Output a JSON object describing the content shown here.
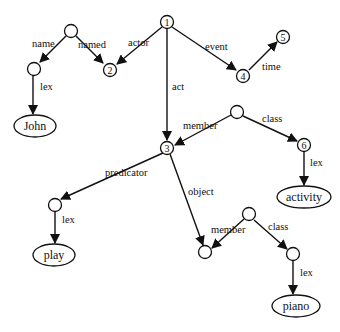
{
  "diagram": {
    "type": "semantic-network",
    "nodes": {
      "n1": {
        "label": "1"
      },
      "n2": {
        "label": "2"
      },
      "n3": {
        "label": "3"
      },
      "n4": {
        "label": "4"
      },
      "n5": {
        "label": "5"
      },
      "n6": {
        "label": "6"
      },
      "john": {
        "label": "John"
      },
      "activity": {
        "label": "activity"
      },
      "play": {
        "label": "play"
      },
      "piano": {
        "label": "piano"
      }
    },
    "edges": {
      "name": {
        "label": "name"
      },
      "named": {
        "label": "named"
      },
      "lex_john": {
        "label": "lex"
      },
      "actor": {
        "label": "actor"
      },
      "event": {
        "label": "event"
      },
      "time": {
        "label": "time"
      },
      "act": {
        "label": "act"
      },
      "member1": {
        "label": "member"
      },
      "class1": {
        "label": "class"
      },
      "lex_activity": {
        "label": "lex"
      },
      "predicator": {
        "label": "predicator"
      },
      "lex_play": {
        "label": "lex"
      },
      "object": {
        "label": "object"
      },
      "member2": {
        "label": "member"
      },
      "class2": {
        "label": "class"
      },
      "lex_piano": {
        "label": "lex"
      }
    }
  }
}
